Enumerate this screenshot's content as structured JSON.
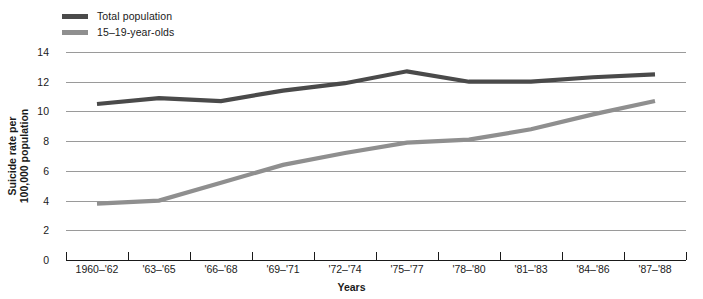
{
  "chart_data": {
    "type": "line",
    "title": "",
    "xlabel": "Years",
    "ylabel": "Suicide rate per 100,000 population",
    "ylim": [
      0,
      14
    ],
    "yticks": [
      0,
      2,
      4,
      6,
      8,
      10,
      12,
      14
    ],
    "grid": true,
    "legend_position": "top-left",
    "categories": [
      "1960–'62",
      "'63–'65",
      "'66–'68",
      "'69–'71",
      "'72–'74",
      "'75–'77",
      "'78–'80",
      "'81–'83",
      "'84–'86",
      "'87–'88"
    ],
    "series": [
      {
        "name": "Total population",
        "color": "#4a4a4a",
        "values": [
          10.5,
          10.9,
          10.7,
          11.4,
          11.9,
          12.7,
          12.0,
          12.0,
          12.3,
          12.5
        ]
      },
      {
        "name": "15–19-year-olds",
        "color": "#8f8f8f",
        "values": [
          3.8,
          4.0,
          5.2,
          6.4,
          7.2,
          7.9,
          8.1,
          8.8,
          9.8,
          10.7
        ]
      }
    ]
  },
  "legend": {
    "items": [
      {
        "label": "Total population",
        "color": "#4a4a4a"
      },
      {
        "label": "15–19-year-olds",
        "color": "#8f8f8f"
      }
    ]
  },
  "axes": {
    "y_title": "Suicide rate per 100,000 population",
    "y_title_line1": "Suicide rate per",
    "y_title_line2": "100,000 population",
    "x_title": "Years",
    "y_tick_labels": [
      "14",
      "12",
      "10",
      "8",
      "6",
      "4",
      "2",
      "0"
    ],
    "x_tick_labels": [
      "1960–'62",
      "'63–'65",
      "'66–'68",
      "'69–'71",
      "'72–'74",
      "'75–'77",
      "'78–'80",
      "'81–'83",
      "'84–'86",
      "'87–'88"
    ]
  },
  "colors": {
    "total_population_line": "#4a4a4a",
    "youth_line": "#8f8f8f",
    "gridline": "#9a9a9a",
    "axis": "#1a1a1a",
    "background": "#ffffff"
  }
}
